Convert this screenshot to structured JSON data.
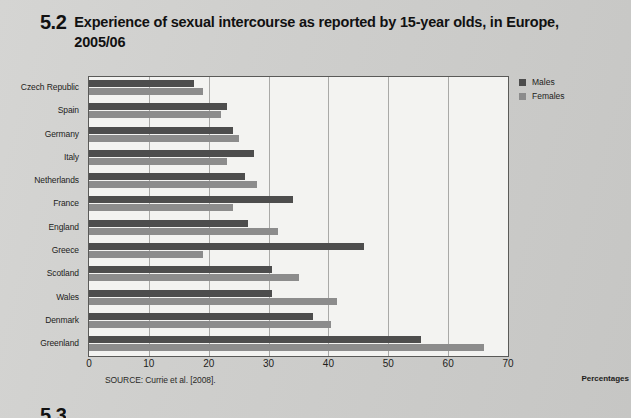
{
  "figure": {
    "number": "5.2",
    "title": "Experience of sexual intercourse as reported by 15-year olds, in Europe, 2005/06",
    "source": "SOURCE: Currie et al. [2008].",
    "axis_unit": "Percentages",
    "next_figure_number": "5.3"
  },
  "legend": {
    "position": "top-right",
    "items": [
      {
        "label": "Males",
        "color": "#4d4d4d"
      },
      {
        "label": "Females",
        "color": "#8c8c8c"
      }
    ]
  },
  "chart_data": {
    "type": "bar",
    "orientation": "horizontal",
    "title": "Experience of sexual intercourse as reported by 15-year olds, in Europe, 2005/06",
    "xlabel": "Percentages",
    "ylabel": "",
    "xlim": [
      0,
      70
    ],
    "xticks": [
      0,
      10,
      20,
      30,
      40,
      50,
      60,
      70
    ],
    "grid": true,
    "categories": [
      "Czech Republic",
      "Spain",
      "Germany",
      "Italy",
      "Netherlands",
      "France",
      "England",
      "Greece",
      "Scotland",
      "Wales",
      "Denmark",
      "Greenland"
    ],
    "series": [
      {
        "name": "Males",
        "color": "#4d4d4d",
        "values": [
          17.5,
          23,
          24,
          27.5,
          26,
          34,
          26.5,
          46,
          30.5,
          30.5,
          37.5,
          55.5
        ]
      },
      {
        "name": "Females",
        "color": "#8c8c8c",
        "values": [
          19,
          22,
          25,
          23,
          28,
          24,
          31.5,
          19,
          35,
          41.5,
          40.5,
          66
        ]
      }
    ]
  }
}
